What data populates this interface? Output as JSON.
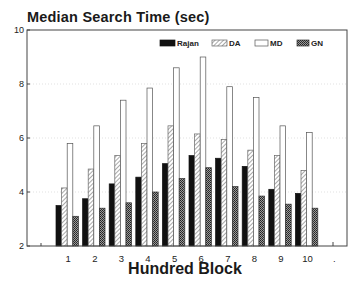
{
  "chart_data": {
    "type": "bar",
    "title": "Median Search Time (sec)",
    "xlabel": "Hundred Block",
    "ylabel": "",
    "ylim": [
      2,
      10
    ],
    "yticks": [
      2,
      4,
      6,
      8,
      10
    ],
    "categories": [
      "1",
      "2",
      "3",
      "4",
      "5",
      "6",
      "7",
      "8",
      "9",
      "10",
      "."
    ],
    "grid": true,
    "legend_position": "top-right",
    "series": [
      {
        "name": "Rajan",
        "fill": "solid-black",
        "values": [
          3.5,
          3.75,
          4.3,
          4.55,
          5.05,
          5.35,
          5.25,
          4.95,
          4.1,
          3.95,
          null
        ]
      },
      {
        "name": "DA",
        "fill": "light-diagonal-hatch",
        "values": [
          4.15,
          4.85,
          5.35,
          5.8,
          6.45,
          6.15,
          5.95,
          5.55,
          5.35,
          4.8,
          null
        ]
      },
      {
        "name": "MD",
        "fill": "white",
        "values": [
          5.8,
          6.45,
          7.4,
          7.85,
          8.6,
          9.0,
          7.9,
          7.5,
          6.45,
          6.2,
          null
        ]
      },
      {
        "name": "GN",
        "fill": "dense-crosshatch",
        "values": [
          3.1,
          3.4,
          3.6,
          4.0,
          4.5,
          4.9,
          4.2,
          3.85,
          3.55,
          3.4,
          null
        ]
      }
    ]
  }
}
